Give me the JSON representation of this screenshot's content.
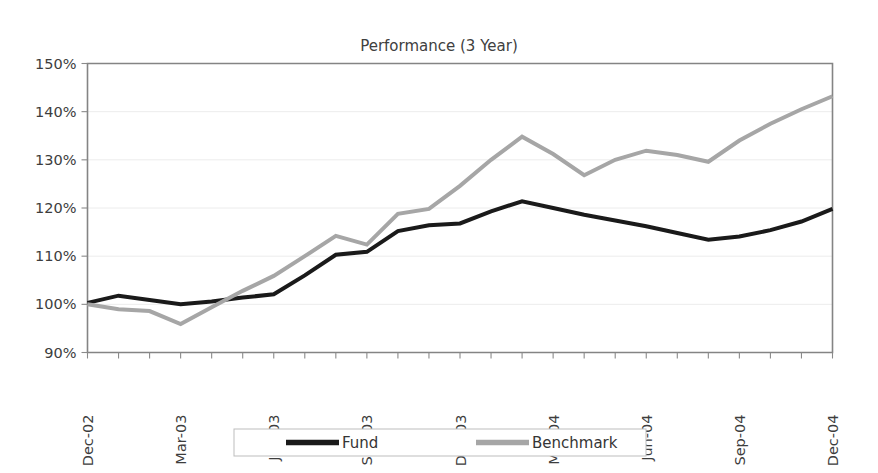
{
  "chart_data": {
    "type": "line",
    "title": "Performance (3 Year)",
    "xlabel": "",
    "ylabel": "",
    "ylim": [
      90,
      150
    ],
    "ytick_labels": [
      "150%",
      "140%",
      "130%",
      "120%",
      "110%",
      "100%",
      "90%"
    ],
    "ytick_values": [
      150,
      140,
      130,
      120,
      110,
      100,
      90
    ],
    "grid": true,
    "legend_position": "bottom",
    "x_labeled_ticks": [
      "Dec-02",
      "Mar-03",
      "Jun-03",
      "Sep-03",
      "Dec-03",
      "Mar-04",
      "Jun-04",
      "Sep-04",
      "Dec-04"
    ],
    "x": [
      "Dec-02",
      "Jan-03",
      "Feb-03",
      "Mar-03",
      "Apr-03",
      "May-03",
      "Jun-03",
      "Jul-03",
      "Aug-03",
      "Sep-03",
      "Oct-03",
      "Nov-03",
      "Dec-03",
      "Jan-04",
      "Feb-04",
      "Mar-04",
      "Apr-04",
      "May-04",
      "Jun-04",
      "Jul-04",
      "Aug-04",
      "Sep-04",
      "Oct-04",
      "Nov-04",
      "Dec-04"
    ],
    "series": [
      {
        "name": "Fund",
        "color": "#1a1a1a",
        "width": 4,
        "values": [
          100.3,
          101.8,
          100.9,
          100.0,
          100.6,
          101.4,
          102.1,
          106.0,
          110.3,
          110.9,
          115.2,
          116.4,
          116.8,
          119.3,
          121.4,
          120.0,
          118.6,
          117.4,
          116.2,
          114.8,
          113.4,
          114.1,
          115.4,
          117.2,
          119.8
        ]
      },
      {
        "name": "Benchmark",
        "color": "#a6a6a6",
        "width": 4,
        "values": [
          100.0,
          99.0,
          98.6,
          95.9,
          99.4,
          102.8,
          105.9,
          110.0,
          114.2,
          112.4,
          118.8,
          119.8,
          124.6,
          130.0,
          134.8,
          131.2,
          126.8,
          130.0,
          131.9,
          131.0,
          129.6,
          134.0,
          137.5,
          140.5,
          143.2
        ]
      }
    ],
    "legend": [
      {
        "label": "Fund",
        "color": "#1a1a1a"
      },
      {
        "label": "Benchmark",
        "color": "#a6a6a6"
      }
    ]
  }
}
